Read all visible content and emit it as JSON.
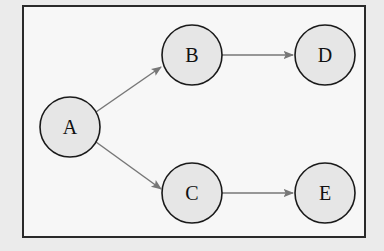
{
  "diagram": {
    "type": "directed-graph",
    "nodes": [
      {
        "id": "A",
        "label": "A",
        "cx": 70,
        "cy": 127,
        "r": 30
      },
      {
        "id": "B",
        "label": "B",
        "cx": 192,
        "cy": 55,
        "r": 30
      },
      {
        "id": "C",
        "label": "C",
        "cx": 192,
        "cy": 193,
        "r": 30
      },
      {
        "id": "D",
        "label": "D",
        "cx": 325,
        "cy": 55,
        "r": 30
      },
      {
        "id": "E",
        "label": "E",
        "cx": 325,
        "cy": 193,
        "r": 30
      }
    ],
    "edges": [
      {
        "from": "A",
        "to": "B"
      },
      {
        "from": "A",
        "to": "C"
      },
      {
        "from": "B",
        "to": "D"
      },
      {
        "from": "C",
        "to": "E"
      }
    ],
    "colors": {
      "node_fill": "#e6e6e6",
      "node_stroke": "#1a1a1a",
      "edge": "#777777",
      "frame": "#2a2a2a",
      "background": "#f7f7f7"
    }
  }
}
